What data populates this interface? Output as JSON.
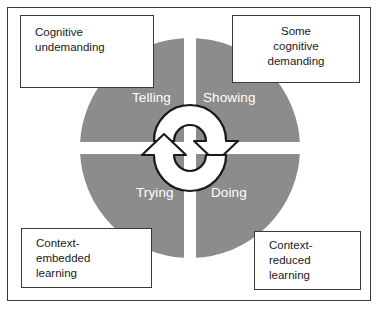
{
  "diagram": {
    "colors": {
      "quadrant_fill": "#8c8c8c",
      "quadrant_label_text": "#ffffff",
      "box_border": "#3a3a3a",
      "frame_border": "#3a3a3a",
      "background": "#ffffff",
      "arrow_fill": "#ffffff",
      "arrow_stroke": "#1a1a1a"
    },
    "quadrants": [
      {
        "id": "top-left",
        "label": "Telling"
      },
      {
        "id": "top-right",
        "label": "Showing"
      },
      {
        "id": "bottom-left",
        "label": "Trying"
      },
      {
        "id": "bottom-right",
        "label": "Doing"
      }
    ],
    "captions": {
      "top_left": {
        "lines": [
          "Cognitive",
          "undemanding"
        ],
        "line1": "Cognitive",
        "line2": "undemanding"
      },
      "top_right": {
        "lines": [
          "Some",
          "cognitive",
          "demanding"
        ],
        "line1": "Some",
        "line2": "cognitive",
        "line3": "demanding"
      },
      "bottom_left": {
        "lines": [
          "Context-",
          "embedded",
          "learning"
        ],
        "line1": "Context-",
        "line2": "embedded",
        "line3": "learning"
      },
      "bottom_right": {
        "lines": [
          "Context-",
          "reduced",
          "learning"
        ],
        "line1": "Context-",
        "line2": "reduced",
        "line3": "learning"
      }
    },
    "center_icon": {
      "name": "cycle-arrows-icon",
      "description": "Two white curved semicircular arrows forming a clockwise cycle at the centre of the wheel",
      "arrows": [
        {
          "id": "upper-arrow",
          "direction": "clockwise-to-right"
        },
        {
          "id": "lower-arrow",
          "direction": "clockwise-to-left"
        }
      ]
    }
  }
}
